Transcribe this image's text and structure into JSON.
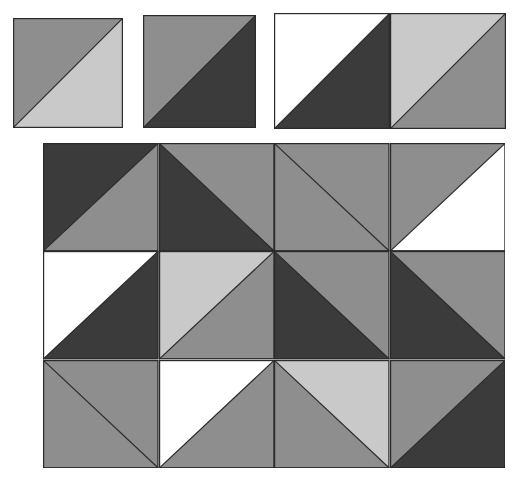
{
  "figure": {
    "background_color": "#ffffff",
    "width": 517,
    "height": 483
  },
  "palette": {
    "white": "#ffffff",
    "light_gray": "#c9c9c9",
    "medium_gray": "#8e8e8e",
    "dark_gray": "#3b3b3b",
    "outline": "#2b2b2b",
    "outline_width": 1.2
  },
  "sample_tiles": {
    "label": "sample tiles row",
    "count": 4,
    "tiles": [
      {
        "name": "tile-1",
        "x": 13,
        "y": 18,
        "size": 110,
        "diagonal": "bl-tr",
        "upper_fill": "medium_gray",
        "lower_fill": "light_gray"
      },
      {
        "name": "tile-2",
        "x": 143,
        "y": 15,
        "size": 113,
        "diagonal": "bl-tr",
        "upper_fill": "medium_gray",
        "lower_fill": "dark_gray"
      },
      {
        "name": "tile-3",
        "x": 274,
        "y": 13,
        "size": 116,
        "diagonal": "bl-tr",
        "upper_fill": "white",
        "lower_fill": "dark_gray"
      },
      {
        "name": "tile-4",
        "x": 390,
        "y": 13,
        "size": 116,
        "diagonal": "bl-tr",
        "upper_fill": "light_gray",
        "lower_fill": "medium_gray"
      }
    ]
  },
  "pattern_grid": {
    "label": "four by three assembled pattern",
    "columns": 4,
    "rows": 3,
    "cell_width": 115.5,
    "cell_height": 108.3,
    "cells": [
      {
        "name": "cell-r0-c0",
        "row": 0,
        "col": 0,
        "diagonal": "bl-tr",
        "upper_fill": "dark_gray",
        "lower_fill": "medium_gray"
      },
      {
        "name": "cell-r0-c1",
        "row": 0,
        "col": 1,
        "diagonal": "tl-br",
        "upper_fill": "medium_gray",
        "lower_fill": "dark_gray"
      },
      {
        "name": "cell-r0-c2",
        "row": 0,
        "col": 2,
        "diagonal": "tl-br",
        "upper_fill": "medium_gray",
        "lower_fill": "medium_gray"
      },
      {
        "name": "cell-r0-c3",
        "row": 0,
        "col": 3,
        "diagonal": "bl-tr",
        "upper_fill": "medium_gray",
        "lower_fill": "white"
      },
      {
        "name": "cell-r1-c0",
        "row": 1,
        "col": 0,
        "diagonal": "bl-tr",
        "upper_fill": "white",
        "lower_fill": "dark_gray"
      },
      {
        "name": "cell-r1-c1",
        "row": 1,
        "col": 1,
        "diagonal": "bl-tr",
        "upper_fill": "light_gray",
        "lower_fill": "medium_gray"
      },
      {
        "name": "cell-r1-c2",
        "row": 1,
        "col": 2,
        "diagonal": "tl-br",
        "upper_fill": "medium_gray",
        "lower_fill": "dark_gray"
      },
      {
        "name": "cell-r1-c3",
        "row": 1,
        "col": 3,
        "diagonal": "tl-br",
        "upper_fill": "medium_gray",
        "lower_fill": "dark_gray"
      },
      {
        "name": "cell-r2-c0",
        "row": 2,
        "col": 0,
        "diagonal": "tl-br",
        "upper_fill": "medium_gray",
        "lower_fill": "medium_gray"
      },
      {
        "name": "cell-r2-c1",
        "row": 2,
        "col": 1,
        "diagonal": "bl-tr",
        "upper_fill": "white",
        "lower_fill": "medium_gray"
      },
      {
        "name": "cell-r2-c2",
        "row": 2,
        "col": 2,
        "diagonal": "tl-br",
        "upper_fill": "light_gray",
        "lower_fill": "medium_gray"
      },
      {
        "name": "cell-r2-c3",
        "row": 2,
        "col": 3,
        "diagonal": "bl-tr",
        "upper_fill": "medium_gray",
        "lower_fill": "dark_gray"
      }
    ]
  }
}
